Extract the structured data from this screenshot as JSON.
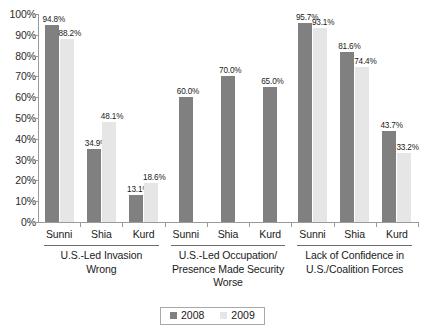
{
  "chart_data": {
    "type": "bar",
    "title": "",
    "subtitle": "",
    "xlabel": "",
    "ylabel": "",
    "ylim": [
      0,
      100
    ],
    "ytick_labels": [
      "100%",
      "90%",
      "80%",
      "70%",
      "60%",
      "50%",
      "40%",
      "30%",
      "20%",
      "10%",
      "0%"
    ],
    "ytick_values": [
      100,
      90,
      80,
      70,
      60,
      50,
      40,
      30,
      20,
      10,
      0
    ],
    "grid": false,
    "legend_position": "bottom-center",
    "series": [
      {
        "name": "2008",
        "color": "#808080"
      },
      {
        "name": "2009",
        "color": "#e6e6e6"
      }
    ],
    "categories": [
      "Sunni",
      "Shia",
      "Kurd",
      "Sunni",
      "Shia",
      "Kurd",
      "Sunni",
      "Shia",
      "Kurd"
    ],
    "groups": [
      {
        "title": "U.S.-Led Invasion Wrong",
        "title_lines": [
          "U.S.-Led Invasion",
          "Wrong"
        ],
        "categories": [
          "Sunni",
          "Shia",
          "Kurd"
        ],
        "values_2008": [
          94.8,
          34.9,
          13.1
        ],
        "values_2009": [
          88.2,
          48.1,
          18.6
        ],
        "labels_2008": [
          "94.8%",
          "34.9%",
          "13.1%"
        ],
        "labels_2009": [
          "88.2%",
          "48.1%",
          "18.6%"
        ]
      },
      {
        "title": "U.S.-Led Occupation/ Presence Made Security Worse",
        "title_lines": [
          "U.S.-Led Occupation/",
          "Presence Made Security",
          "Worse"
        ],
        "categories": [
          "Sunni",
          "Shia",
          "Kurd"
        ],
        "values_2008": [
          60.0,
          70.0,
          65.0
        ],
        "values_2009": [
          null,
          null,
          null
        ],
        "labels_2008": [
          "60.0%",
          "70.0%",
          "65.0%"
        ],
        "labels_2009": [
          "",
          "",
          ""
        ]
      },
      {
        "title": "Lack of Confidence in U.S./Coalition Forces",
        "title_lines": [
          "Lack of Confidence in",
          "U.S./Coalition Forces"
        ],
        "categories": [
          "Sunni",
          "Shia",
          "Kurd"
        ],
        "values_2008": [
          95.7,
          81.6,
          43.7
        ],
        "values_2009": [
          93.1,
          74.4,
          33.2
        ],
        "labels_2008": [
          "95.7%",
          "81.6%",
          "43.7%"
        ],
        "labels_2009": [
          "93.1%",
          "74.4%",
          "33.2%"
        ]
      }
    ]
  },
  "legend": {
    "items": [
      {
        "label": "2008",
        "color": "#808080"
      },
      {
        "label": "2009",
        "color": "#e6e6e6"
      }
    ]
  },
  "yaxis": {
    "ticks": [
      {
        "label": "100%",
        "value": 100
      },
      {
        "label": "90%",
        "value": 90
      },
      {
        "label": "80%",
        "value": 80
      },
      {
        "label": "70%",
        "value": 70
      },
      {
        "label": "60%",
        "value": 60
      },
      {
        "label": "50%",
        "value": 50
      },
      {
        "label": "40%",
        "value": 40
      },
      {
        "label": "30%",
        "value": 30
      },
      {
        "label": "20%",
        "value": 20
      },
      {
        "label": "10%",
        "value": 10
      },
      {
        "label": "0%",
        "value": 0
      }
    ]
  },
  "colors": {
    "series_2008": "#808080",
    "series_2009": "#e6e6e6",
    "axis": "#9a9a9a",
    "text": "#1a1a1a",
    "background": "#ffffff"
  }
}
